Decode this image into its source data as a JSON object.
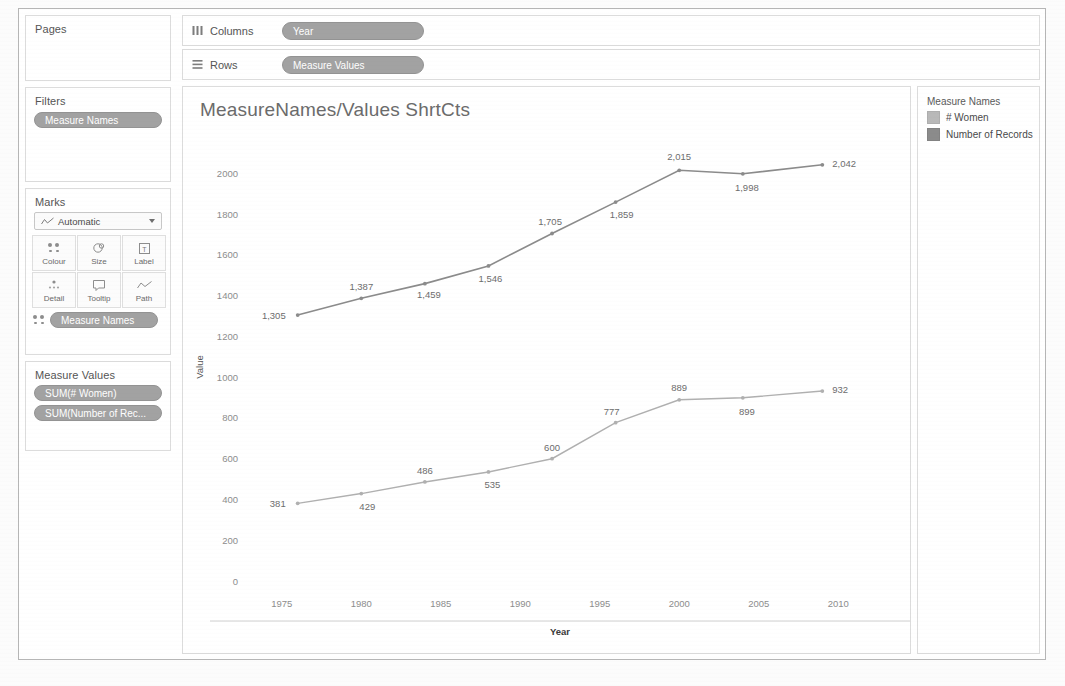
{
  "app": {
    "shelves": {
      "pages_label": "Pages",
      "filters_label": "Filters",
      "marks_label": "Marks",
      "measure_values_label": "Measure Values",
      "columns_label": "Columns",
      "rows_label": "Rows",
      "columns_pill": "Year",
      "rows_pill": "Measure Values",
      "filters_pill": "Measure Names",
      "marks_pill": "Measure Names",
      "measure_value_pills": [
        "SUM(# Women)",
        "SUM(Number of Rec..."
      ],
      "columns_icon": "columns-icon",
      "rows_icon": "rows-icon"
    },
    "marks": {
      "type_label": "Automatic",
      "type_icon": "line-chart-icon",
      "buttons": [
        {
          "label": "Colour",
          "icon": "colour-dots-icon"
        },
        {
          "label": "Size",
          "icon": "size-circle-icon"
        },
        {
          "label": "Label",
          "icon": "label-text-icon"
        },
        {
          "label": "Detail",
          "icon": "detail-dots-icon"
        },
        {
          "label": "Tooltip",
          "icon": "tooltip-bubble-icon"
        },
        {
          "label": "Path",
          "icon": "path-line-icon"
        }
      ]
    },
    "legend": {
      "title": "Measure Names",
      "items": [
        {
          "label": "# Women",
          "color": "#b9b9b9"
        },
        {
          "label": "Number of Records",
          "color": "#8b8b8b"
        }
      ]
    }
  },
  "chart_data": {
    "type": "line",
    "title": "MeasureNames/Values ShrtCts",
    "xlabel": "Year",
    "ylabel": "Value",
    "xlim": [
      1973,
      2012
    ],
    "ylim": [
      0,
      2100
    ],
    "xticks": [
      1975,
      1980,
      1985,
      1990,
      1995,
      2000,
      2005,
      2010
    ],
    "yticks": [
      0,
      200,
      400,
      600,
      800,
      1000,
      1200,
      1400,
      1600,
      1800,
      2000
    ],
    "grid": false,
    "legend_position": "right",
    "x": [
      1976,
      1980,
      1984,
      1988,
      1992,
      1996,
      2000,
      2004,
      2009
    ],
    "series": [
      {
        "name": "Number of Records",
        "color": "#8b8b8b",
        "values": [
          1305,
          1387,
          1459,
          1546,
          1705,
          1859,
          2015,
          1998,
          2042
        ],
        "labels": [
          "1,305",
          "1,387",
          "1,459",
          "1,546",
          "1,705",
          "1,859",
          "2,015",
          "1,998",
          "2,042"
        ]
      },
      {
        "name": "# Women",
        "color": "#b0b0b0",
        "values": [
          381,
          429,
          486,
          535,
          600,
          777,
          889,
          899,
          932
        ],
        "labels": [
          "381",
          "429",
          "486",
          "535",
          "600",
          "777",
          "889",
          "899",
          "932"
        ]
      }
    ]
  }
}
